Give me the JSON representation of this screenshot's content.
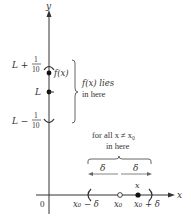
{
  "diagram": {
    "type": "epsilon-delta limit illustration",
    "axes": {
      "y_label": "y",
      "x_label": "x",
      "origin_label": "0"
    },
    "y_axis_marks": {
      "upper": {
        "base": "L + ",
        "num": "1",
        "den": "10"
      },
      "center": "L",
      "lower": {
        "base": "L − ",
        "num": "1",
        "den": "10"
      }
    },
    "fx_point_label": "f(x)",
    "y_brace_text": [
      "f(x) lies",
      "in here"
    ],
    "x_brace_text": [
      "for all x ≠ x₀",
      "in here"
    ],
    "delta_labels": [
      "δ",
      "δ"
    ],
    "x_axis_marks": {
      "left": "x₀ − δ",
      "center": "x₀",
      "point": "x",
      "right": "x₀ + δ"
    },
    "colors": {
      "ink": "#333333",
      "brace": "#666666",
      "background": "#ffffff"
    }
  }
}
